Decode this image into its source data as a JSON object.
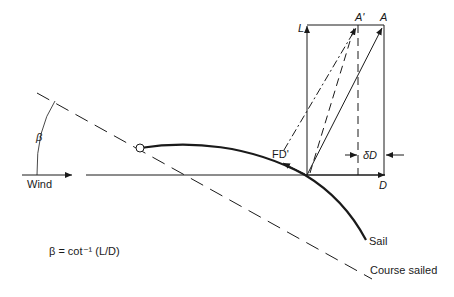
{
  "diagram": {
    "labels": {
      "L": "L",
      "A_prime": "A'",
      "A": "A",
      "FD": "FD'",
      "delta_D": "δD",
      "D": "D",
      "wind": "Wind",
      "beta": "β",
      "sail": "Sail",
      "course": "Course sailed",
      "formula": "β = cot⁻¹  (L/D)"
    },
    "colors": {
      "line": "#1a1a1a",
      "background": "#ffffff"
    }
  }
}
